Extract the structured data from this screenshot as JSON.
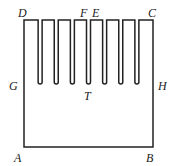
{
  "diagram": {
    "slot_count": 7,
    "labels": {
      "D": "D",
      "F": "F",
      "E": "E",
      "C": "C",
      "G": "G",
      "H": "H",
      "T": "T",
      "A": "A",
      "B": "B"
    }
  }
}
